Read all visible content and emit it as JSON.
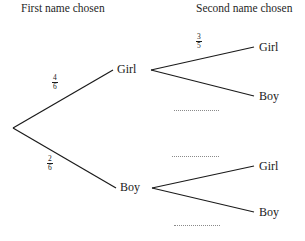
{
  "headers": {
    "first": "First name chosen",
    "second": "Second name chosen"
  },
  "stage1": {
    "girl": {
      "label": "Girl",
      "probability_numerator": "4",
      "probability_denominator": "6"
    },
    "boy": {
      "label": "Boy",
      "probability_numerator": "2",
      "probability_denominator": "6"
    }
  },
  "stage2": {
    "girl_girl": {
      "label": "Girl",
      "probability_numerator": "3",
      "probability_denominator": "5"
    },
    "girl_boy": {
      "label": "Boy",
      "probability_blank": true
    },
    "boy_girl": {
      "label": "Girl",
      "probability_blank": true
    },
    "boy_boy": {
      "label": "Boy",
      "probability_blank": true
    }
  },
  "style": {
    "line_color": "#1a1a1a",
    "blank_color": "#8a8a8a",
    "background": "#ffffff"
  }
}
